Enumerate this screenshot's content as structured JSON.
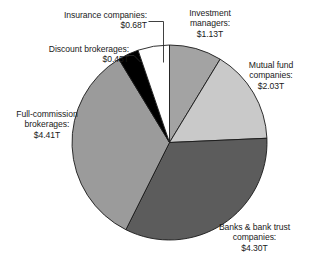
{
  "chart_data": {
    "type": "pie",
    "title": "",
    "subtitle": "",
    "units": "trillions of USD",
    "total": 13.0,
    "start_angle_deg": 0,
    "direction": "clockwise",
    "legend": "none",
    "grid": false,
    "categories": [
      "Investment managers",
      "Mutual fund companies",
      "Banks & bank trust companies",
      "Full-commission brokerages",
      "Discount brokerages",
      "Insurance companies"
    ],
    "values": [
      1.13,
      2.03,
      4.3,
      4.41,
      0.45,
      0.68
    ],
    "value_labels": [
      "$1.13T",
      "$2.03T",
      "$4.30T",
      "$4.41T",
      "$0.45T",
      "$0.68T"
    ],
    "colors": [
      "#a3a3a3",
      "#c9c9c9",
      "#5c5c5c",
      "#9b9b9b",
      "#000000",
      "#ffffff"
    ],
    "slices": [
      {
        "name": "investment-managers",
        "label_lines": [
          "Investment",
          "managers:",
          "$1.13T"
        ],
        "value": 1.13,
        "value_label": "$1.13T",
        "percent": 8.7,
        "angle_deg": 31.3,
        "color": "#a3a3a3",
        "leader_line": false
      },
      {
        "name": "mutual-fund-companies",
        "label_lines": [
          "Mutual fund",
          "companies:",
          "$2.03T"
        ],
        "value": 2.03,
        "value_label": "$2.03T",
        "percent": 15.6,
        "angle_deg": 56.2,
        "color": "#c9c9c9",
        "leader_line": false
      },
      {
        "name": "banks-and-bank-trust-companies",
        "label_lines": [
          "Banks & bank trust",
          "companies:",
          "$4.30T"
        ],
        "value": 4.3,
        "value_label": "$4.30T",
        "percent": 33.1,
        "angle_deg": 119.1,
        "color": "#5c5c5c",
        "leader_line": false
      },
      {
        "name": "full-commission-brokerages",
        "label_lines": [
          "Full-commission",
          "brokerages:",
          "$4.41T"
        ],
        "value": 4.41,
        "value_label": "$4.41T",
        "percent": 33.9,
        "angle_deg": 122.1,
        "color": "#9b9b9b",
        "leader_line": false
      },
      {
        "name": "discount-brokerages",
        "label_lines": [
          "Discount brokerages:",
          "$0.45T"
        ],
        "value": 0.45,
        "value_label": "$0.45T",
        "percent": 3.5,
        "angle_deg": 12.5,
        "color": "#000000",
        "leader_line": true
      },
      {
        "name": "insurance-companies",
        "label_lines": [
          "Insurance companies:",
          "$0.68T"
        ],
        "value": 0.68,
        "value_label": "$0.68T",
        "percent": 5.2,
        "angle_deg": 18.8,
        "color": "#ffffff",
        "leader_line": true
      }
    ]
  },
  "labels": {
    "investment": {
      "l1": "Investment",
      "l2": "managers:",
      "l3": "$1.13T"
    },
    "mutual": {
      "l1": "Mutual fund",
      "l2": "companies:",
      "l3": "$2.03T"
    },
    "banks": {
      "l1": "Banks & bank trust",
      "l2": "companies:",
      "l3": "$4.30T"
    },
    "fullcomm": {
      "l1": "Full-commission",
      "l2": "brokerages:",
      "l3": "$4.41T"
    },
    "discount": {
      "l1": "Discount brokerages:",
      "l2": "$0.45T"
    },
    "insurance": {
      "l1": "Insurance companies:",
      "l2": "$0.68T"
    }
  },
  "style": {
    "outline_color": "#1a1a1a",
    "background": "#ffffff",
    "leader_color": "#2b2b2b"
  }
}
